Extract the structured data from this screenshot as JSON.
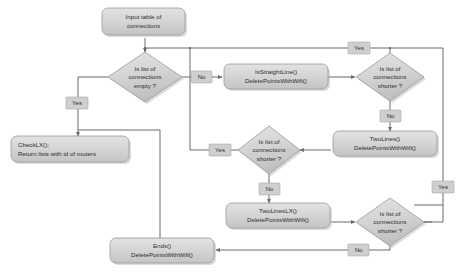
{
  "diagram": {
    "background_color": "#ffffff",
    "node_fill_color": "#d5d5d5",
    "node_border_color": "#9a9a9a",
    "edge_color": "#6b6b6b",
    "label_chip_color": "#cfcfcf"
  },
  "nodes": {
    "input": {
      "type": "rounded-box",
      "line1": "Input table of",
      "line2": "connections"
    },
    "decision_empty": {
      "type": "diamond",
      "line1": "Is list of",
      "line2": "connections",
      "line3": "empty ?"
    },
    "checklx": {
      "type": "rounded-box",
      "line1": "CheckLX();",
      "line2": "Return lists with id of routers"
    },
    "isstraightline": {
      "type": "rounded-box",
      "line1": "IsStraightLine()",
      "line2": "DeletePointsWithWifi()"
    },
    "decision_shorter_1": {
      "type": "diamond",
      "line1": "Is list of",
      "line2": "connections",
      "line3": "shorter ?"
    },
    "twolines": {
      "type": "rounded-box",
      "line1": "TwoLines()",
      "line2": "DeletePointsWithWifi()"
    },
    "decision_shorter_2": {
      "type": "diamond",
      "line1": "Is list of",
      "line2": "connections",
      "line3": "shorter ?"
    },
    "twolineslx": {
      "type": "rounded-box",
      "line1": "TwoLinesLX()",
      "line2": "DeletePointsWithWifi()"
    },
    "decision_shorter_3": {
      "type": "diamond",
      "line1": "Is list of",
      "line2": "connections",
      "line3": "shorter ?"
    },
    "ends": {
      "type": "rounded-box",
      "line1": "Ends()",
      "line2": "DeletePointsWithWifi()"
    }
  },
  "edge_labels": {
    "empty_yes": "Yes",
    "empty_no": "No",
    "shorter1_yes_top": "Yes",
    "shorter1_no": "No",
    "shorter2_yes": "Yes",
    "shorter2_no": "No",
    "shorter3_yes": "Yes",
    "shorter3_no": "No"
  }
}
